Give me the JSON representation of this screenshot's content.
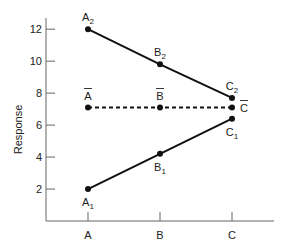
{
  "chart_data": {
    "type": "line",
    "title": "",
    "xlabel": "",
    "ylabel": "Response",
    "categories": [
      "A",
      "B",
      "C"
    ],
    "yticks": [
      2,
      4,
      6,
      8,
      10,
      12
    ],
    "ylim": [
      0,
      12.7
    ],
    "grid": false,
    "legend": "none",
    "series": [
      {
        "name": "Level 2",
        "style": "solid",
        "values": [
          12.0,
          9.8,
          7.7
        ],
        "point_labels": [
          {
            "base": "A",
            "sub": "2"
          },
          {
            "base": "B",
            "sub": "2"
          },
          {
            "base": "C",
            "sub": "2"
          }
        ],
        "label_position": [
          "above",
          "above",
          "above"
        ]
      },
      {
        "name": "Mean",
        "style": "dashed",
        "values": [
          7.1,
          7.1,
          7.1
        ],
        "point_labels": [
          {
            "base": "A",
            "bar": true
          },
          {
            "base": "B",
            "bar": true
          },
          {
            "base": "C",
            "bar": true
          }
        ],
        "label_position": [
          "above",
          "above",
          "right"
        ]
      },
      {
        "name": "Level 1",
        "style": "solid",
        "values": [
          2.0,
          4.2,
          6.4
        ],
        "point_labels": [
          {
            "base": "A",
            "sub": "1"
          },
          {
            "base": "B",
            "sub": "1"
          },
          {
            "base": "C",
            "sub": "1"
          }
        ],
        "label_position": [
          "below",
          "below",
          "below"
        ]
      }
    ],
    "colors": {
      "line": "#111111",
      "axis": "#555555",
      "text": "#222222"
    }
  }
}
